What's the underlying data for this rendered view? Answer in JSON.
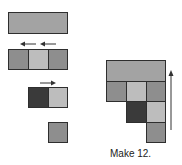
{
  "diagram": {
    "caption": "Make 12.",
    "colors": {
      "bar": "#a3a3a3",
      "medium": "#8e8e8e",
      "light": "#bdbdbd",
      "dark": "#3a3a3a",
      "border": "#2e2e2e"
    },
    "left_pieces": [
      {
        "name": "long-bar",
        "cells": [
          "bar"
        ]
      },
      {
        "name": "three-squares",
        "cells": [
          "medium",
          "light",
          "medium"
        ],
        "arrows": "two left-pointing arrows"
      },
      {
        "name": "two-squares",
        "cells": [
          "dark",
          "light"
        ],
        "arrows": "one right-pointing arrow"
      },
      {
        "name": "one-square",
        "cells": [
          "medium"
        ]
      }
    ],
    "assembled_shape": {
      "rows": [
        [
          "bar(3 wide)"
        ],
        [
          "medium",
          "light",
          "medium"
        ],
        [
          "",
          "dark",
          "light"
        ],
        [
          "",
          "",
          "medium"
        ]
      ],
      "arrow": "upward arrow on right side"
    }
  }
}
